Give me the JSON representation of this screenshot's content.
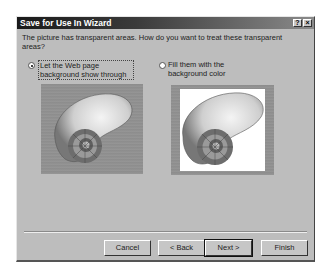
{
  "window": {
    "title": "Save for Use In Wizard",
    "help_button": "?",
    "close_button": "×"
  },
  "prompt": "The picture has transparent areas.  How do you want to treat these transparent areas?",
  "options": [
    {
      "label": "Let the Web page background show through",
      "selected": true,
      "image": "nautilus-shell-on-textured-background"
    },
    {
      "label": "Fill them with the background color",
      "selected": false,
      "image": "nautilus-shell-on-white-fill"
    }
  ],
  "buttons": {
    "cancel": "Cancel",
    "back": "< Back",
    "next": "Next >",
    "finish": "Finish"
  },
  "colors": {
    "dialog_bg": "#bdbdbd",
    "titlebar": "#1a1a1a"
  }
}
